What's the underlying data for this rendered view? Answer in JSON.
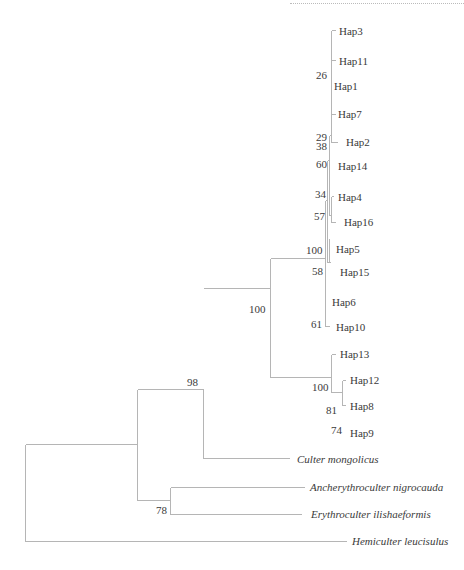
{
  "tip_labels": {
    "hap3": "Hap3",
    "hap11": "Hap11",
    "hap1": "Hap1",
    "hap7": "Hap7",
    "hap2": "Hap2",
    "hap14": "Hap14",
    "hap4": "Hap4",
    "hap16": "Hap16",
    "hap5": "Hap5",
    "hap15": "Hap15",
    "hap6": "Hap6",
    "hap10": "Hap10",
    "hap13": "Hap13",
    "hap12": "Hap12",
    "hap8": "Hap8",
    "hap9": "Hap9",
    "culter_mongolicus": "Culter mongolicus",
    "ancherythroculter_nigrocauda": "Ancherythroculter nigrocauda",
    "erythroculter_ilishaeformis": "Erythroculter ilishaeformis",
    "hemiculter_leucisulus": "Hemiculter leucisulus"
  },
  "bootstrap": {
    "b26": "26",
    "b29": "29",
    "b38": "38",
    "b60": "60",
    "b34": "34",
    "b57": "57",
    "b100a": "100",
    "b58": "58",
    "b61": "61",
    "b100b": "100",
    "b100c": "100",
    "b81": "81",
    "b74": "74",
    "b98": "98",
    "b78": "78"
  },
  "colors": {
    "branch": "#b5b5b5",
    "text": "#3a3a3a"
  }
}
